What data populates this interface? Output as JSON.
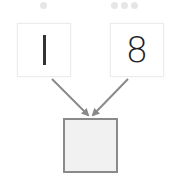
{
  "diagram": {
    "left_operand": {
      "value": "1",
      "dot_count": 1
    },
    "right_operand": {
      "value": "8",
      "dot_count": 3
    },
    "answer_box": {
      "value": ""
    },
    "colors": {
      "arrow": "#8a8a8a",
      "answer_border": "#8a8a8a",
      "answer_fill": "#f1f1f1",
      "card_border": "#ececec",
      "dot": "#e6e6e6",
      "digit": "#222222"
    },
    "icons": {
      "arrow_left": "arrow-down-right-icon",
      "arrow_right": "arrow-down-left-icon"
    }
  }
}
